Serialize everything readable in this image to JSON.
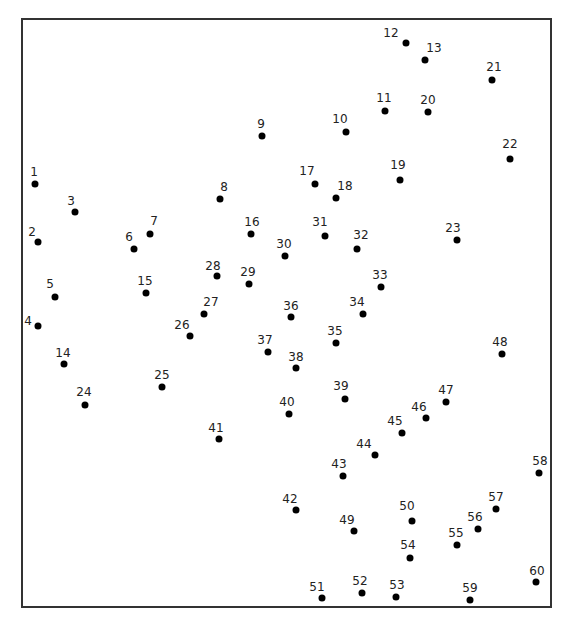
{
  "colors": {
    "dot": "#000000",
    "label": "#222222",
    "frame": "#333333"
  },
  "dots": [
    {
      "n": "1",
      "x": 35,
      "y": 184,
      "lx": 34,
      "ly": 178
    },
    {
      "n": "2",
      "x": 38,
      "y": 242,
      "lx": 32,
      "ly": 238
    },
    {
      "n": "3",
      "x": 75,
      "y": 212,
      "lx": 71,
      "ly": 207
    },
    {
      "n": "4",
      "x": 38,
      "y": 326,
      "lx": 28,
      "ly": 327
    },
    {
      "n": "5",
      "x": 55,
      "y": 297,
      "lx": 50,
      "ly": 290
    },
    {
      "n": "6",
      "x": 134,
      "y": 249,
      "lx": 129,
      "ly": 243
    },
    {
      "n": "7",
      "x": 150,
      "y": 234,
      "lx": 154,
      "ly": 227
    },
    {
      "n": "8",
      "x": 220,
      "y": 199,
      "lx": 224,
      "ly": 193
    },
    {
      "n": "9",
      "x": 262,
      "y": 136,
      "lx": 261,
      "ly": 130
    },
    {
      "n": "10",
      "x": 346,
      "y": 132,
      "lx": 340,
      "ly": 125
    },
    {
      "n": "11",
      "x": 385,
      "y": 111,
      "lx": 384,
      "ly": 104
    },
    {
      "n": "12",
      "x": 406,
      "y": 43,
      "lx": 391,
      "ly": 39
    },
    {
      "n": "13",
      "x": 425,
      "y": 60,
      "lx": 434,
      "ly": 54
    },
    {
      "n": "20",
      "x": 428,
      "y": 112,
      "lx": 428,
      "ly": 106
    },
    {
      "n": "21",
      "x": 492,
      "y": 80,
      "lx": 494,
      "ly": 73
    },
    {
      "n": "22",
      "x": 510,
      "y": 159,
      "lx": 510,
      "ly": 150
    },
    {
      "n": "17",
      "x": 315,
      "y": 184,
      "lx": 307,
      "ly": 177
    },
    {
      "n": "18",
      "x": 336,
      "y": 198,
      "lx": 345,
      "ly": 192
    },
    {
      "n": "19",
      "x": 400,
      "y": 180,
      "lx": 398,
      "ly": 171
    },
    {
      "n": "14",
      "x": 64,
      "y": 364,
      "lx": 63,
      "ly": 359
    },
    {
      "n": "15",
      "x": 146,
      "y": 293,
      "lx": 145,
      "ly": 287
    },
    {
      "n": "16",
      "x": 251,
      "y": 234,
      "lx": 252,
      "ly": 228
    },
    {
      "n": "23",
      "x": 457,
      "y": 240,
      "lx": 453,
      "ly": 234
    },
    {
      "n": "24",
      "x": 85,
      "y": 405,
      "lx": 84,
      "ly": 398
    },
    {
      "n": "25",
      "x": 162,
      "y": 387,
      "lx": 162,
      "ly": 381
    },
    {
      "n": "26",
      "x": 190,
      "y": 336,
      "lx": 182,
      "ly": 331
    },
    {
      "n": "27",
      "x": 204,
      "y": 314,
      "lx": 211,
      "ly": 308
    },
    {
      "n": "28",
      "x": 217,
      "y": 276,
      "lx": 213,
      "ly": 272
    },
    {
      "n": "29",
      "x": 249,
      "y": 284,
      "lx": 248,
      "ly": 278
    },
    {
      "n": "30",
      "x": 285,
      "y": 256,
      "lx": 284,
      "ly": 250
    },
    {
      "n": "31",
      "x": 325,
      "y": 236,
      "lx": 320,
      "ly": 228
    },
    {
      "n": "32",
      "x": 357,
      "y": 249,
      "lx": 361,
      "ly": 241
    },
    {
      "n": "33",
      "x": 381,
      "y": 287,
      "lx": 380,
      "ly": 281
    },
    {
      "n": "34",
      "x": 363,
      "y": 314,
      "lx": 357,
      "ly": 308
    },
    {
      "n": "35",
      "x": 336,
      "y": 343,
      "lx": 335,
      "ly": 337
    },
    {
      "n": "36",
      "x": 291,
      "y": 317,
      "lx": 291,
      "ly": 312
    },
    {
      "n": "37",
      "x": 268,
      "y": 352,
      "lx": 265,
      "ly": 346
    },
    {
      "n": "38",
      "x": 296,
      "y": 368,
      "lx": 296,
      "ly": 363
    },
    {
      "n": "39",
      "x": 345,
      "y": 399,
      "lx": 341,
      "ly": 392
    },
    {
      "n": "40",
      "x": 289,
      "y": 414,
      "lx": 287,
      "ly": 408
    },
    {
      "n": "41",
      "x": 219,
      "y": 439,
      "lx": 216,
      "ly": 434
    },
    {
      "n": "42",
      "x": 296,
      "y": 510,
      "lx": 290,
      "ly": 505
    },
    {
      "n": "43",
      "x": 343,
      "y": 476,
      "lx": 339,
      "ly": 470
    },
    {
      "n": "44",
      "x": 375,
      "y": 455,
      "lx": 364,
      "ly": 450
    },
    {
      "n": "45",
      "x": 402,
      "y": 433,
      "lx": 395,
      "ly": 427
    },
    {
      "n": "46",
      "x": 426,
      "y": 418,
      "lx": 419,
      "ly": 413
    },
    {
      "n": "47",
      "x": 446,
      "y": 402,
      "lx": 446,
      "ly": 396
    },
    {
      "n": "48",
      "x": 502,
      "y": 354,
      "lx": 500,
      "ly": 348
    },
    {
      "n": "49",
      "x": 354,
      "y": 531,
      "lx": 347,
      "ly": 526
    },
    {
      "n": "50",
      "x": 412,
      "y": 521,
      "lx": 407,
      "ly": 512
    },
    {
      "n": "51",
      "x": 322,
      "y": 598,
      "lx": 317,
      "ly": 593
    },
    {
      "n": "52",
      "x": 362,
      "y": 593,
      "lx": 360,
      "ly": 587
    },
    {
      "n": "53",
      "x": 396,
      "y": 597,
      "lx": 397,
      "ly": 591
    },
    {
      "n": "54",
      "x": 410,
      "y": 558,
      "lx": 408,
      "ly": 551
    },
    {
      "n": "55",
      "x": 457,
      "y": 545,
      "lx": 456,
      "ly": 539
    },
    {
      "n": "56",
      "x": 478,
      "y": 529,
      "lx": 475,
      "ly": 523
    },
    {
      "n": "57",
      "x": 496,
      "y": 509,
      "lx": 496,
      "ly": 503
    },
    {
      "n": "58",
      "x": 539,
      "y": 473,
      "lx": 540,
      "ly": 467
    },
    {
      "n": "59",
      "x": 470,
      "y": 600,
      "lx": 470,
      "ly": 594
    },
    {
      "n": "60",
      "x": 536,
      "y": 582,
      "lx": 537,
      "ly": 577
    }
  ]
}
